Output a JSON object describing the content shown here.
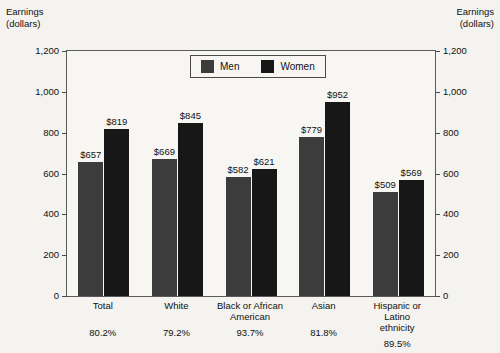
{
  "chart_data": {
    "type": "bar",
    "title": "",
    "ylabel": "Earnings\n(dollars)",
    "ylabel_right": "Earnings\n(dollars)",
    "xlabel": "",
    "ylim": [
      0,
      1200
    ],
    "yticks": [
      0,
      200,
      400,
      600,
      800,
      1000,
      1200
    ],
    "ytick_labels": [
      "0",
      "200",
      "400",
      "600",
      "800",
      "1,000",
      "1,200"
    ],
    "grid": false,
    "legend_position": "top-center",
    "categories": [
      "Total",
      "White",
      "Black or African\nAmerican",
      "Asian",
      "Hispanic or Latino\nethnicity"
    ],
    "series": [
      {
        "name": "Men",
        "color": "#3c3c3c",
        "values": [
          657,
          669,
          582,
          779,
          509
        ]
      },
      {
        "name": "Women",
        "color": "#171717",
        "values": [
          819,
          845,
          621,
          952,
          569
        ]
      }
    ],
    "value_labels": {
      "Men": [
        "$657",
        "$669",
        "$582",
        "$779",
        "$509"
      ],
      "Women": [
        "$819",
        "$845",
        "$621",
        "$952",
        "$569"
      ]
    },
    "annotations": {
      "label": "women-to-men earnings ratio",
      "values": [
        "80.2%",
        "79.2%",
        "93.7%",
        "81.8%",
        "89.5%"
      ]
    }
  },
  "colors": {
    "background": "#f4f3ef",
    "plot_background": "#f7f6f3",
    "axis": "#5a5a5a",
    "men": "#3c3c3c",
    "women": "#171717"
  }
}
